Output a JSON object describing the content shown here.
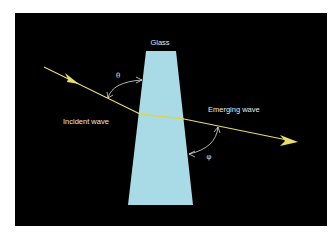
{
  "diagram": {
    "labels": {
      "glass": "Glass",
      "incident": "Incident wave",
      "emerging": "Emerging wave",
      "theta": "θ",
      "phi": "φ"
    },
    "colors": {
      "background": "#000000",
      "frame": "#ffffff",
      "glass": "#a9dbe6",
      "ray": "#e8dc6a",
      "text": "#e8e8e8",
      "angle_arrows": "#dcdcdc"
    }
  }
}
